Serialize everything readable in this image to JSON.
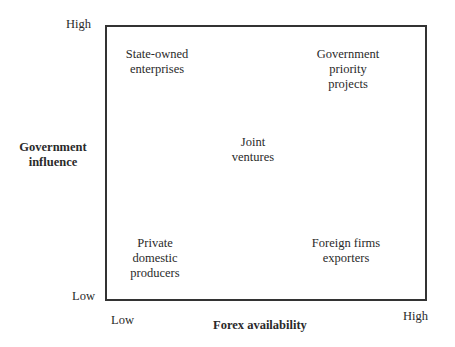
{
  "diagram": {
    "type": "2x2 matrix",
    "y_axis": {
      "title_line1": "Government",
      "title_line2": "influence",
      "high_label": "High",
      "low_label": "Low"
    },
    "x_axis": {
      "title": "Forex availability",
      "low_label": "Low",
      "high_label": "High"
    },
    "quadrants": {
      "top_left": {
        "lines": [
          "State-owned",
          "enterprises"
        ]
      },
      "top_right": {
        "lines": [
          "Government",
          "priority",
          "projects"
        ]
      },
      "center": {
        "lines": [
          "Joint",
          "ventures"
        ]
      },
      "bottom_left": {
        "lines": [
          "Private",
          "domestic",
          "producers"
        ]
      },
      "bottom_right": {
        "lines": [
          "Foreign firms",
          "exporters"
        ]
      }
    },
    "colors": {
      "line": "#333333",
      "text": "#2a2a2a",
      "background": "#ffffff"
    }
  }
}
